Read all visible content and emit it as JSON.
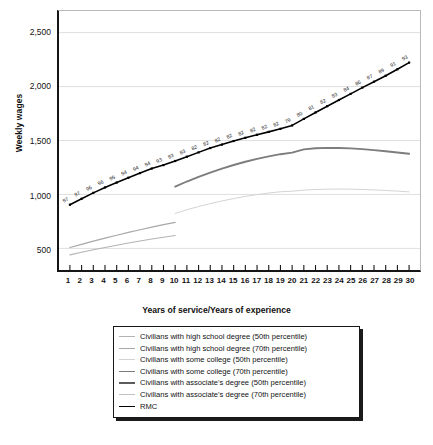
{
  "chart_data": {
    "type": "line",
    "title": "",
    "xlabel": "Years of service/Years of experience",
    "ylabel": "Weekly wages",
    "xlim": [
      1,
      30
    ],
    "ylim": [
      300,
      2700
    ],
    "grid": true,
    "legend_position": "below-plot",
    "xticks": [
      "1",
      "2",
      "3",
      "4",
      "5",
      "6",
      "7",
      "8",
      "9",
      "10",
      "11",
      "12",
      "13",
      "14",
      "15",
      "16",
      "17",
      "18",
      "19",
      "20",
      "21",
      "22",
      "23",
      "24",
      "25",
      "26",
      "27",
      "28",
      "29",
      "30"
    ],
    "yticks": [
      "500",
      "1,000",
      "1,500",
      "2,000",
      "2,500"
    ],
    "ytick_values": [
      500,
      1000,
      1500,
      2000,
      2500
    ],
    "x": [
      1,
      2,
      3,
      4,
      5,
      6,
      7,
      8,
      9,
      10,
      11,
      12,
      13,
      14,
      15,
      16,
      17,
      18,
      19,
      20,
      21,
      22,
      23,
      24,
      25,
      26,
      27,
      28,
      29,
      30
    ],
    "series": [
      {
        "name": "Civilians with high school degree (50th percentile)",
        "color": "#b3b3b3",
        "width": 1.1,
        "x": [
          1,
          2,
          3,
          4,
          5,
          6,
          7,
          8,
          9,
          10
        ],
        "values": [
          440,
          464,
          487,
          509,
          530,
          550,
          569,
          587,
          604,
          620
        ]
      },
      {
        "name": "Civilians with high school degree (70th percentile)",
        "color": "#a8a8a8",
        "width": 1.2,
        "x": [
          1,
          2,
          3,
          4,
          5,
          6,
          7,
          8,
          9,
          10
        ],
        "values": [
          508,
          538,
          567,
          595,
          622,
          648,
          673,
          697,
          720,
          742
        ]
      },
      {
        "name": "Civilians with some college (50th percentile)",
        "color": "#d2d2d2",
        "width": 1.0,
        "x": [
          10,
          11,
          12,
          13,
          14,
          15,
          16,
          17,
          18,
          19,
          20,
          21,
          22,
          23,
          24,
          25,
          26,
          27,
          28,
          29,
          30
        ],
        "values": [
          825,
          858,
          888,
          915,
          940,
          962,
          982,
          999,
          1013,
          1025,
          1030,
          1040,
          1046,
          1049,
          1050,
          1049,
          1046,
          1042,
          1037,
          1031,
          1024
        ]
      },
      {
        "name": "Civilians with some college (70th percentile)",
        "color": "#7d7d7d",
        "width": 1.9,
        "x": [
          10,
          11,
          12,
          13,
          14,
          15,
          16,
          17,
          18,
          19,
          20,
          21,
          22,
          23,
          24,
          25,
          26,
          27,
          28,
          29,
          30
        ],
        "values": [
          1073,
          1120,
          1163,
          1203,
          1240,
          1273,
          1303,
          1330,
          1353,
          1373,
          1388,
          1418,
          1428,
          1432,
          1431,
          1427,
          1420,
          1411,
          1400,
          1389,
          1377
        ]
      },
      {
        "name": "Civilians with associate's degree (50th percentile)",
        "color": "#5c5c5c",
        "width": 2.0,
        "x": [],
        "values": []
      },
      {
        "name": "Civilians with associate's degree (70th percentile)",
        "color": "#c2c2c2",
        "width": 1.1,
        "x": [],
        "values": []
      },
      {
        "name": "RMC",
        "color": "#000000",
        "width": 1.6,
        "markers": true,
        "x": [
          1,
          2,
          3,
          4,
          5,
          6,
          7,
          8,
          9,
          10,
          11,
          12,
          13,
          14,
          15,
          16,
          17,
          18,
          19,
          20,
          21,
          22,
          23,
          24,
          25,
          26,
          27,
          28,
          29,
          30
        ],
        "values": [
          905,
          960,
          1015,
          1065,
          1110,
          1155,
          1198,
          1240,
          1272,
          1310,
          1350,
          1390,
          1430,
          1462,
          1495,
          1525,
          1553,
          1580,
          1608,
          1640,
          1700,
          1760,
          1818,
          1875,
          1932,
          1990,
          2045,
          2100,
          2160,
          2222
        ],
        "point_labels": [
          "97",
          "97",
          "96",
          "96",
          "95",
          "94",
          "94",
          "94",
          "93",
          "83",
          "83",
          "82",
          "82",
          "82",
          "82",
          "82",
          "82",
          "82",
          "82",
          "79",
          "80",
          "81",
          "82",
          "83",
          "84",
          "86",
          "87",
          "89",
          "91",
          "93"
        ],
        "point_label_note": "percentile of civilian wage distribution"
      }
    ]
  }
}
